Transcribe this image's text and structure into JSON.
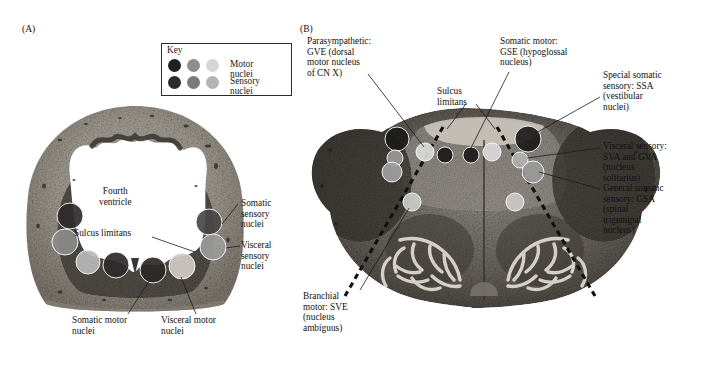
{
  "figure": {
    "panel_a_tag": "(A)",
    "panel_b_tag": "(B)"
  },
  "key": {
    "title": "Key",
    "rows": [
      {
        "label": "Motor nuclei",
        "colors": [
          "#231f20",
          "#8e8e8e",
          "#d6d6d6"
        ]
      },
      {
        "label": "Sensory nuclei",
        "colors": [
          "#2b2b2b",
          "#7a7a7a",
          "#b4b4b4"
        ]
      }
    ]
  },
  "panel_a": {
    "labels": {
      "fourth_ventricle": "Fourth\nventricle",
      "sulcus_limitans": "Sulcus limitans",
      "somatic_sensory": "Somatic\nsensory\nnuclei",
      "visceral_sensory": "Visceral\nsensory\nnuclei",
      "somatic_motor": "Somatic motor\nnuclei",
      "visceral_motor": "Visceral motor\nnuclei"
    },
    "nuclei": [
      {
        "name": "somatic-motor-left",
        "cx": 70,
        "cy": 216,
        "r": 13,
        "fill": "#2e2b2a"
      },
      {
        "name": "visceral-motor-left",
        "cx": 65,
        "cy": 242,
        "r": 13,
        "fill": "#8b8b8b"
      },
      {
        "name": "visceral-sensory-left",
        "cx": 88,
        "cy": 262,
        "r": 12,
        "fill": "#b9b9b9"
      },
      {
        "name": "somatic-motor-mid-l",
        "cx": 116,
        "cy": 265,
        "r": 13,
        "fill": "#2e2b2a"
      },
      {
        "name": "somatic-motor-mid-r",
        "cx": 153,
        "cy": 270,
        "r": 13,
        "fill": "#2b2827"
      },
      {
        "name": "visceral-motor-right",
        "cx": 182,
        "cy": 266,
        "r": 13,
        "fill": "#cfcbc4"
      },
      {
        "name": "somatic-sensory-right",
        "cx": 209,
        "cy": 222,
        "r": 13,
        "fill": "#4a4745"
      },
      {
        "name": "visceral-sensory-right",
        "cx": 213,
        "cy": 247,
        "r": 13,
        "fill": "#9b9b9b"
      }
    ]
  },
  "panel_b": {
    "labels": {
      "parasympathetic": "Parasympathetic:\nGVE (dorsal\nmotor nucleus\nof CN X)",
      "sulcus_limitans": "Sulcus\nlimitans",
      "somatic_motor": "Somatic motor:\nGSE (hypoglossal\nnucleus)",
      "special_somatic_sensory": "Special somatic\nsensory: SSA\n(vestibular\nnuclei)",
      "visceral_sensory": "Visceral sensory:\nSVA and GVA\n(nucleus\nsolitarius)",
      "general_somatic_sensory": "General somatic\nsensory: GSA\n(spinal\ntrigeminal\nnucleus)",
      "branchial_motor": "Branchial\nmotor: SVE\n(nucleus\nambiguus)"
    },
    "nuclei": [
      {
        "name": "vestibular-left",
        "cx": 397,
        "cy": 139,
        "r": 12,
        "fill": "#1b1b1b"
      },
      {
        "name": "solitarius-left",
        "cx": 395,
        "cy": 158,
        "r": 8,
        "fill": "#9a9a9a"
      },
      {
        "name": "spinal-trigeminal-left",
        "cx": 392,
        "cy": 172,
        "r": 10,
        "fill": "#9f9f9f"
      },
      {
        "name": "dorsal-motor-vagus-left",
        "cx": 425,
        "cy": 152,
        "r": 9,
        "fill": "#d9d9d9"
      },
      {
        "name": "hypoglossal-left",
        "cx": 445,
        "cy": 155,
        "r": 8,
        "fill": "#1b1b1b"
      },
      {
        "name": "hypoglossal-right",
        "cx": 471,
        "cy": 155,
        "r": 8,
        "fill": "#1b1b1b"
      },
      {
        "name": "dorsal-motor-vagus-right",
        "cx": 492,
        "cy": 152,
        "r": 9,
        "fill": "#d9d9d9"
      },
      {
        "name": "vestibular-right",
        "cx": 528,
        "cy": 139,
        "r": 13,
        "fill": "#1b1b1b"
      },
      {
        "name": "solitarius-right",
        "cx": 520,
        "cy": 160,
        "r": 8,
        "fill": "#b2b2b2"
      },
      {
        "name": "spinal-trigeminal-right",
        "cx": 533,
        "cy": 172,
        "r": 11,
        "fill": "#9a9a9a"
      },
      {
        "name": "ambiguus-left",
        "cx": 412,
        "cy": 202,
        "r": 9,
        "fill": "#c9c9c9"
      },
      {
        "name": "ambiguus-right",
        "cx": 515,
        "cy": 202,
        "r": 9,
        "fill": "#c9c9c9"
      }
    ]
  }
}
